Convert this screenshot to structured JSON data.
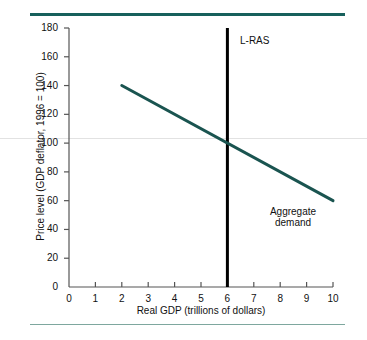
{
  "chart_data": {
    "type": "line",
    "title": "",
    "xlabel": "Real GDP (trillions of dollars)",
    "ylabel": "Price level (GDP deflator, 1996 = 100)",
    "xlim": [
      0,
      10
    ],
    "ylim": [
      0,
      180
    ],
    "xticks": [
      "0",
      "1",
      "2",
      "3",
      "4",
      "5",
      "6",
      "7",
      "8",
      "9",
      "10"
    ],
    "yticks": [
      "0",
      "20",
      "40",
      "60",
      "80",
      "100",
      "120",
      "140",
      "160",
      "180"
    ],
    "grid": false,
    "legend_position": "inline-annotations",
    "series": [
      {
        "name": "Aggregate demand",
        "label": "Aggregate demand",
        "label_line1": "Aggregate",
        "label_line2": "demand",
        "color": "#1a5450",
        "x": [
          2,
          10
        ],
        "y": [
          140,
          60
        ]
      },
      {
        "name": "L-RAS",
        "label": "L-RAS",
        "color": "#000000",
        "x": [
          6,
          6
        ],
        "y": [
          0,
          180
        ]
      }
    ],
    "annotations": [
      {
        "text": "L-RAS",
        "x": 6.5,
        "y": 172
      },
      {
        "text": "Aggregate demand",
        "x": 8.6,
        "y": 48
      }
    ],
    "intersection": {
      "x": 6,
      "y": 100
    }
  },
  "figure": {
    "rule_top_color": "#17605c",
    "rule_bottom_color": "#7ea79e",
    "axis_color": "#555555",
    "background": "#ffffff"
  }
}
